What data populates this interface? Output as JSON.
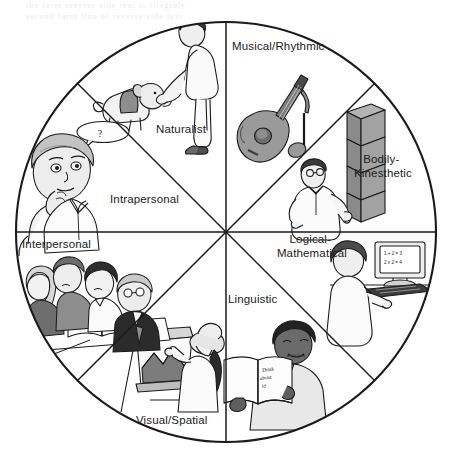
{
  "diagram": {
    "type": "circular-wheel",
    "shape": "circle divided into eight equal 45-degree sectors",
    "title_visible": false,
    "center": {
      "x": 226,
      "y": 232
    },
    "radius": 211,
    "stroke_color": "#1a1a1a",
    "background_color": "#ffffff",
    "sectors": [
      {
        "id": "musical-rhythmic",
        "label": "Musical/Rhythmic",
        "label_lines": [
          "Musical/Rhythmic"
        ],
        "position": "top-right-inner",
        "illustration": "acoustic guitar with eighth note",
        "label_x": 232,
        "label_y": 50
      },
      {
        "id": "bodily-kinesthetic",
        "label": "Bodily-Kinesthetic",
        "label_lines": [
          "Bodily-",
          "Kinesthetic"
        ],
        "position": "right-upper",
        "illustration": "man stacking cardboard boxes",
        "label_x": 383,
        "label_y": 163
      },
      {
        "id": "logical-mathematical",
        "label": "Logical-Mathematical",
        "label_lines": [
          "Logical-",
          "Mathematical"
        ],
        "position": "right-lower",
        "illustration": "person at computer with math on screen",
        "label_x": 271,
        "label_y": 243
      },
      {
        "id": "linguistic",
        "label": "Linguistic",
        "label_lines": [
          "Linguistic"
        ],
        "position": "bottom-right",
        "illustration": "man reading an open book",
        "label_x": 228,
        "label_y": 299
      },
      {
        "id": "visual-spatial",
        "label": "Visual/Spatial",
        "label_lines": [
          "Visual/Spatial"
        ],
        "position": "bottom-left",
        "illustration": "woman in hat painting at an easel",
        "label_x": 136,
        "label_y": 424
      },
      {
        "id": "interpersonal",
        "label": "Interpersonal",
        "label_lines": [
          "Interpersonal"
        ],
        "position": "left-lower",
        "illustration": "group of four people at a table with an open book",
        "label_x": 22,
        "label_y": 248
      },
      {
        "id": "intrapersonal",
        "label": "Intrapersonal",
        "label_lines": [
          "Intrapersonal"
        ],
        "position": "left-upper",
        "illustration": "man thinking with hand on chin and thought bubble",
        "label_x": 110,
        "label_y": 203
      },
      {
        "id": "naturalist",
        "label": "Naturalist",
        "label_lines": [
          "Naturalist"
        ],
        "position": "top-left-inner",
        "illustration": "person greeting a dog",
        "label_x": 156,
        "label_y": 133
      }
    ],
    "inline_text": {
      "computer_screen_line1": "1 + 2 = 3",
      "computer_screen_line2": "2 x 2 = 4",
      "book_line1": "Think",
      "book_line2": "about",
      "book_line3": "it!",
      "thought_bubble": "?"
    },
    "scan_artifact": {
      "description": "faint grey bleed-through text from reverse page along the top margin",
      "line1": "the faint reverse side text is illegible",
      "line2": "second faint line of reverse side text"
    }
  }
}
